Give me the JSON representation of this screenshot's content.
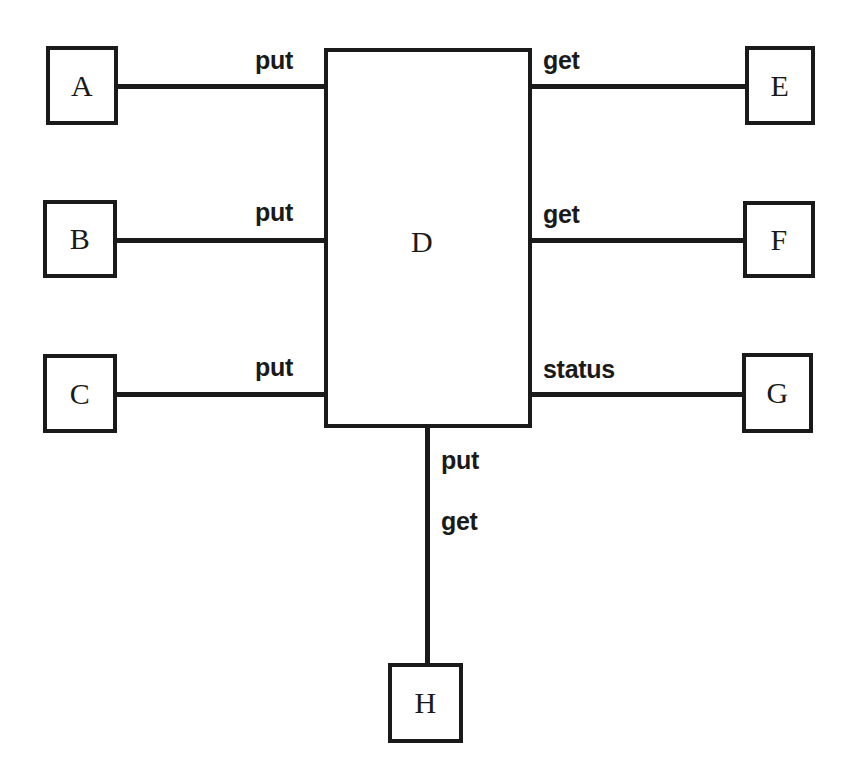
{
  "diagram": {
    "background_color": "#ffffff",
    "stroke_color": "#1a1a1a",
    "nodes": [
      {
        "id": "A",
        "label": "A",
        "x": 46,
        "y": 46,
        "w": 72,
        "h": 79
      },
      {
        "id": "B",
        "label": "B",
        "x": 43,
        "y": 200,
        "w": 74,
        "h": 78
      },
      {
        "id": "C",
        "label": "C",
        "x": 43,
        "y": 354,
        "w": 74,
        "h": 79
      },
      {
        "id": "D",
        "label": "D",
        "x": 324,
        "y": 48,
        "w": 208,
        "h": 380
      },
      {
        "id": "E",
        "label": "E",
        "x": 745,
        "y": 46,
        "w": 70,
        "h": 79
      },
      {
        "id": "F",
        "label": "F",
        "x": 743,
        "y": 201,
        "w": 72,
        "h": 77
      },
      {
        "id": "G",
        "label": "G",
        "x": 742,
        "y": 353,
        "w": 71,
        "h": 80
      },
      {
        "id": "H",
        "label": "H",
        "x": 388,
        "y": 663,
        "w": 75,
        "h": 80
      }
    ],
    "edges": [
      {
        "from": "A",
        "to": "D",
        "label": "put",
        "orientation": "horizontal",
        "x": 116,
        "y": 84,
        "length": 212,
        "label_x": 255,
        "label_y": 48
      },
      {
        "from": "B",
        "to": "D",
        "label": "put",
        "orientation": "horizontal",
        "x": 115,
        "y": 238,
        "length": 213,
        "label_x": 255,
        "label_y": 200
      },
      {
        "from": "C",
        "to": "D",
        "label": "put",
        "orientation": "horizontal",
        "x": 115,
        "y": 392,
        "length": 213,
        "label_x": 255,
        "label_y": 355
      },
      {
        "from": "D",
        "to": "E",
        "label": "get",
        "orientation": "horizontal",
        "x": 528,
        "y": 84,
        "length": 221,
        "label_x": 543,
        "label_y": 48
      },
      {
        "from": "D",
        "to": "F",
        "label": "get",
        "orientation": "horizontal",
        "x": 528,
        "y": 238,
        "length": 219,
        "label_x": 543,
        "label_y": 202
      },
      {
        "from": "D",
        "to": "G",
        "label": "status",
        "orientation": "horizontal",
        "x": 528,
        "y": 392,
        "length": 218,
        "label_x": 543,
        "label_y": 357
      },
      {
        "from": "D",
        "to": "H",
        "label": "put",
        "orientation": "vertical",
        "x": 425,
        "y": 424,
        "length": 243,
        "label_x": 441,
        "label_y": 448
      },
      {
        "from": "D",
        "to": "H",
        "label": "get",
        "orientation": "vertical",
        "x": 425,
        "y": 424,
        "length": 0,
        "label_x": 441,
        "label_y": 509
      }
    ],
    "hub_label_position": {
      "x": 411,
      "y": 227
    }
  }
}
